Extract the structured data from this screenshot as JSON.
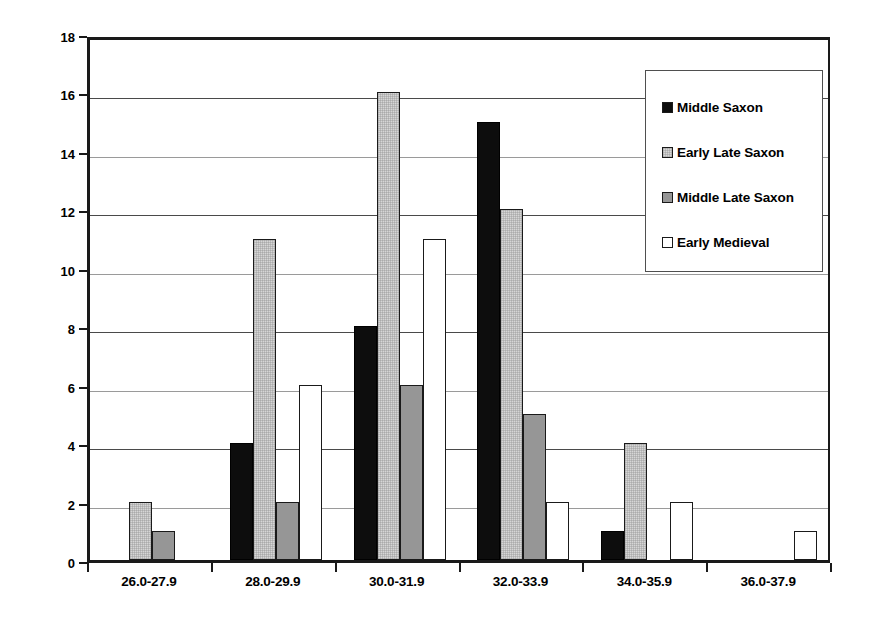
{
  "chart_data": {
    "type": "bar",
    "title": "",
    "xlabel": "",
    "ylabel": "Number of Teeth",
    "ylim": [
      0,
      18
    ],
    "ytick_step": 2,
    "yticks": [
      0,
      2,
      4,
      6,
      8,
      10,
      12,
      14,
      16,
      18
    ],
    "grid": true,
    "legend_position": "top-right",
    "categories": [
      "26.0-27.9",
      "28.0-29.9",
      "30.0-31.9",
      "32.0-33.9",
      "34.0-35.9",
      "36.0-37.9"
    ],
    "series": [
      {
        "name": "Middle Saxon",
        "color": "#0d0d0d",
        "values": [
          0,
          4,
          8,
          15,
          1,
          0
        ]
      },
      {
        "name": "Early Late Saxon",
        "color": "#d6d6d6",
        "values": [
          2,
          11,
          16,
          12,
          4,
          0
        ]
      },
      {
        "name": "Middle Late Saxon",
        "color": "#969696",
        "values": [
          1,
          2,
          6,
          5,
          0,
          0
        ]
      },
      {
        "name": "Early Medieval",
        "color": "#ffffff",
        "values": [
          0,
          6,
          11,
          2,
          2,
          1
        ]
      }
    ]
  },
  "axes": {
    "y_title": "Number of Teeth"
  },
  "legend": {
    "entries": [
      {
        "label": "Middle Saxon",
        "swatch": "#0d0d0d"
      },
      {
        "label": "Early Late Saxon",
        "swatch": "#d6d6d6"
      },
      {
        "label": "Middle Late Saxon",
        "swatch": "#969696"
      },
      {
        "label": "Early Medieval",
        "swatch": "#ffffff"
      }
    ]
  }
}
